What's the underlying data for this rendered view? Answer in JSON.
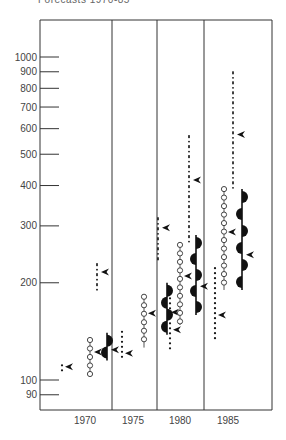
{
  "header": {
    "title": "Forecasts 1970-85"
  },
  "chart_data": {
    "type": "range",
    "title": "Forecasts 1970-85",
    "xlabel": "",
    "ylabel": "",
    "yscale": "log",
    "ylim": [
      85,
      1050
    ],
    "y_ticks": [
      90,
      100,
      200,
      300,
      400,
      500,
      600,
      700,
      800,
      900,
      1000
    ],
    "y_tick_labels": [
      "90",
      "100",
      "200",
      "300",
      "400",
      "500",
      "600",
      "700",
      "800",
      "900",
      "1000"
    ],
    "categories": [
      "1970",
      "1975",
      "1980",
      "1985"
    ],
    "grid": false,
    "legend": null,
    "series": [
      {
        "name": "dotted",
        "style": "dotted",
        "ranges": [
          [
            105,
            111
          ],
          [
            114,
            141
          ],
          [
            124,
            179
          ],
          [
            133,
            222
          ]
        ],
        "medians": [
          110,
          121,
          143,
          159
        ]
      },
      {
        "name": "circles",
        "style": "open-circle-chain",
        "ranges": [
          [
            104,
            133
          ],
          [
            126,
            181
          ],
          [
            148,
            262
          ],
          [
            190,
            390
          ]
        ],
        "medians": [
          122,
          161,
          210,
          287
        ]
      },
      {
        "name": "dashed",
        "style": "dash-dot",
        "ranges": [
          [
            187,
            230
          ],
          [
            232,
            319
          ],
          [
            271,
            573
          ],
          [
            390,
            903
          ]
        ],
        "medians": [
          216,
          296,
          416,
          576
        ]
      },
      {
        "name": "half-discs",
        "style": "solid-with-half-discs",
        "ranges": [
          [
            115,
            140
          ],
          [
            138,
            200
          ],
          [
            159,
            281
          ],
          [
            190,
            390
          ]
        ],
        "medians": [
          124,
          162,
          195,
          244
        ]
      }
    ]
  },
  "layout": {
    "plot": {
      "left": 40,
      "right": 272,
      "top": 20,
      "bottom": 410
    },
    "y_px_100": 380,
    "y_px_1000": 57,
    "dividers": [
      112,
      157,
      204
    ],
    "group_offsets": {
      "1970": [
        62,
        90,
        97,
        107
      ],
      "1975": [
        122,
        144,
        158,
        167
      ],
      "1980": [
        170,
        180,
        189,
        196
      ],
      "1985": [
        215,
        224,
        233,
        242
      ]
    },
    "x_label_px": [
      85,
      133,
      180,
      228
    ]
  }
}
